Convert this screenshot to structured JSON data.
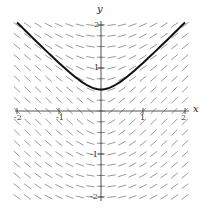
{
  "chart_data": {
    "type": "slope-field",
    "title": "",
    "xlabel": "x",
    "ylabel": "y",
    "xlim": [
      -2,
      2
    ],
    "ylim": [
      -2,
      2
    ],
    "x_ticks": [
      -2,
      -1,
      1,
      2
    ],
    "y_ticks": [
      -2,
      -1,
      1,
      2
    ],
    "x_tick_labels": [
      "-2",
      "-1",
      "1",
      "2"
    ],
    "y_tick_labels": [
      "-2",
      "-1",
      "1",
      "2"
    ],
    "grid": false,
    "field_grid_step": 0.25,
    "differential_equation": "dy/dx = x / sqrt(x^2 + y^2) (approx.)",
    "solution_curve": {
      "equation": "y = sqrt(x^2 + 0.25)",
      "x_range": [
        -2,
        2
      ],
      "min_point": [
        0,
        0.5
      ]
    },
    "colors": {
      "segments": "#9a9a9a",
      "curve": "#111111",
      "axes": "#555555"
    }
  },
  "labels": {
    "x_axis": "x",
    "y_axis": "y",
    "x_tick_neg2": "-2",
    "x_tick_neg1": "-1",
    "x_tick_1": "1",
    "x_tick_2": "2",
    "y_tick_2": "2",
    "y_tick_1": "1",
    "y_tick_neg1": "-1",
    "y_tick_neg2": "-2"
  }
}
